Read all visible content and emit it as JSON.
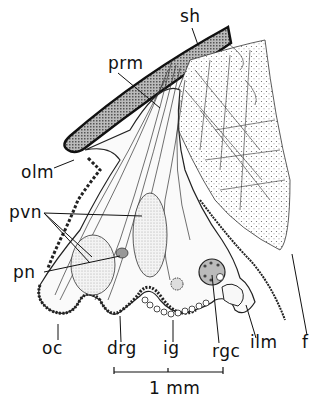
{
  "figure": {
    "labels": {
      "sh": "sh",
      "prm": "prm",
      "olm": "olm",
      "pvn": "pvn",
      "pn": "pn",
      "oc": "oc",
      "drg": "drg",
      "ig": "ig",
      "rgc": "rgc",
      "ilm": "ilm",
      "f": "f"
    },
    "scale_bar": "1 mm"
  }
}
